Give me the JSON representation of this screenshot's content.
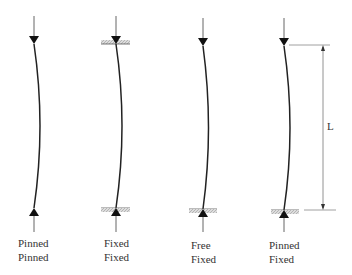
{
  "diagram": {
    "dimension_label": "L",
    "columns": [
      {
        "top": "Pinned",
        "bottom": "Pinned"
      },
      {
        "top": "Fixed",
        "bottom": "Fixed"
      },
      {
        "top": "Free",
        "bottom": "Fixed"
      },
      {
        "top": "Pinned",
        "bottom": "Fixed"
      }
    ]
  }
}
